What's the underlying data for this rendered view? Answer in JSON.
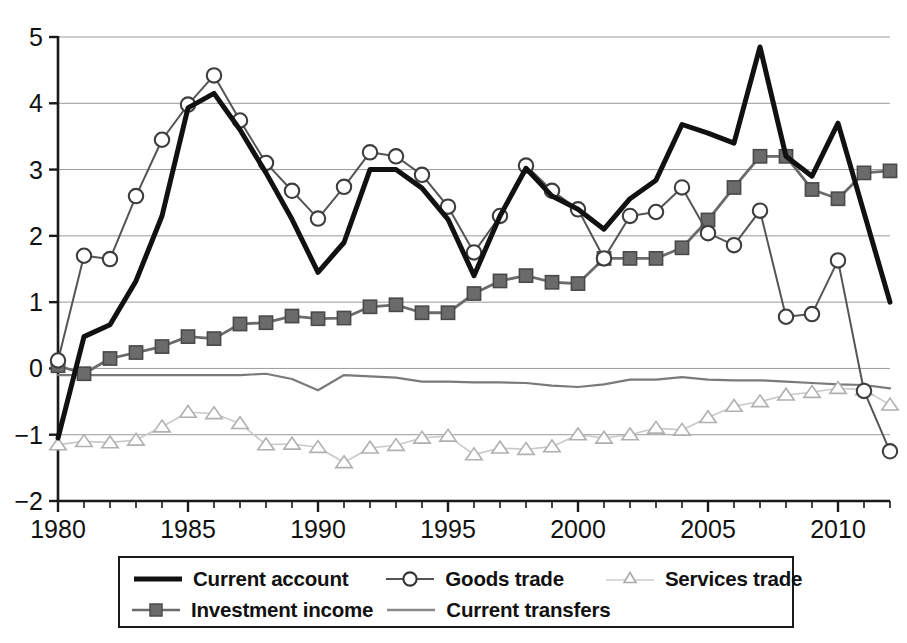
{
  "chart_data": {
    "type": "line",
    "title": "",
    "subtitle": "",
    "xlabel": "",
    "ylabel": "",
    "xlim": [
      1980,
      2012
    ],
    "ylim": [
      -2,
      5
    ],
    "yticks": [
      -2,
      -1,
      0,
      1,
      2,
      3,
      4,
      5
    ],
    "ytick_labels": [
      "−2",
      "−1",
      "0",
      "1",
      "2",
      "3",
      "4",
      "5"
    ],
    "xticks": [
      1980,
      1985,
      1990,
      1995,
      2000,
      2005,
      2010
    ],
    "xtick_labels": [
      "1980",
      "1985",
      "1990",
      "1995",
      "2000",
      "2005",
      "2010"
    ],
    "xtick_minor_step": 1,
    "grid": "horizontal",
    "legend_position": "below",
    "x": [
      1980,
      1981,
      1982,
      1983,
      1984,
      1985,
      1986,
      1987,
      1988,
      1989,
      1990,
      1991,
      1992,
      1993,
      1994,
      1995,
      1996,
      1997,
      1998,
      1999,
      2000,
      2001,
      2002,
      2003,
      2004,
      2005,
      2006,
      2007,
      2008,
      2009,
      2010,
      2011,
      2012
    ],
    "series": [
      {
        "name": "Current account",
        "marker": "none",
        "color": "#111111",
        "width": 5.0,
        "values": [
          -1.05,
          0.48,
          0.66,
          1.32,
          2.3,
          3.93,
          4.15,
          3.6,
          2.95,
          2.25,
          1.45,
          1.9,
          3.0,
          3.0,
          2.72,
          2.25,
          1.4,
          2.3,
          3.02,
          2.6,
          2.4,
          2.1,
          2.56,
          2.84,
          3.68,
          3.55,
          3.4,
          4.85,
          3.2,
          2.9,
          3.7,
          2.35,
          1.0
        ]
      },
      {
        "name": "Goods trade",
        "marker": "circle",
        "color": "#555555",
        "width": 2.0,
        "values": [
          0.12,
          1.7,
          1.65,
          2.6,
          3.45,
          3.98,
          4.42,
          3.74,
          3.1,
          2.68,
          2.26,
          2.74,
          3.26,
          3.2,
          2.92,
          2.44,
          1.75,
          2.3,
          3.06,
          2.68,
          2.4,
          1.66,
          2.3,
          2.36,
          2.73,
          2.04,
          1.86,
          2.38,
          0.78,
          0.82,
          1.63,
          -0.34,
          -1.25
        ]
      },
      {
        "name": "Services trade",
        "marker": "triangle",
        "color": "#c9c9c9",
        "width": 1.6,
        "values": [
          -1.15,
          -1.1,
          -1.12,
          -1.08,
          -0.88,
          -0.66,
          -0.68,
          -0.83,
          -1.15,
          -1.14,
          -1.19,
          -1.42,
          -1.2,
          -1.16,
          -1.05,
          -1.02,
          -1.3,
          -1.2,
          -1.22,
          -1.18,
          -1.0,
          -1.05,
          -1.0,
          -0.9,
          -0.93,
          -0.74,
          -0.57,
          -0.5,
          -0.4,
          -0.36,
          -0.3,
          -0.32,
          -0.55
        ]
      },
      {
        "name": "Investment income",
        "marker": "square",
        "color": "#6b6b6b",
        "width": 2.8,
        "values": [
          0.04,
          -0.08,
          0.15,
          0.24,
          0.33,
          0.48,
          0.45,
          0.67,
          0.69,
          0.79,
          0.75,
          0.76,
          0.93,
          0.96,
          0.84,
          0.84,
          1.13,
          1.32,
          1.4,
          1.3,
          1.28,
          1.66,
          1.66,
          1.66,
          1.82,
          2.24,
          2.73,
          3.2,
          3.2,
          2.7,
          2.56,
          2.95,
          2.98
        ]
      },
      {
        "name": "Current transfers",
        "marker": "none",
        "color": "#7a7a7a",
        "width": 2.2,
        "values": [
          -0.1,
          -0.1,
          -0.1,
          -0.1,
          -0.1,
          -0.1,
          -0.1,
          -0.1,
          -0.08,
          -0.16,
          -0.33,
          -0.1,
          -0.12,
          -0.14,
          -0.2,
          -0.2,
          -0.21,
          -0.21,
          -0.22,
          -0.26,
          -0.28,
          -0.24,
          -0.17,
          -0.17,
          -0.13,
          -0.17,
          -0.18,
          -0.18,
          -0.2,
          -0.22,
          -0.24,
          -0.25,
          -0.3
        ]
      }
    ]
  },
  "legend": {
    "rows": [
      [
        {
          "label": "Current account",
          "icon": "thick-line-swatch"
        },
        {
          "label": "Goods trade",
          "icon": "line-circle-swatch"
        },
        {
          "label": "Services trade",
          "icon": "line-triangle-swatch"
        }
      ],
      [
        {
          "label": "Investment income",
          "icon": "line-square-swatch"
        },
        {
          "label": "Current transfers",
          "icon": "thin-line-swatch"
        }
      ]
    ]
  },
  "axes": {
    "y_labels": [
      "5",
      "4",
      "3",
      "2",
      "1",
      "0",
      "−1",
      "−2"
    ],
    "x_labels": [
      "1980",
      "1985",
      "1990",
      "1995",
      "2000",
      "2005",
      "2010"
    ]
  }
}
